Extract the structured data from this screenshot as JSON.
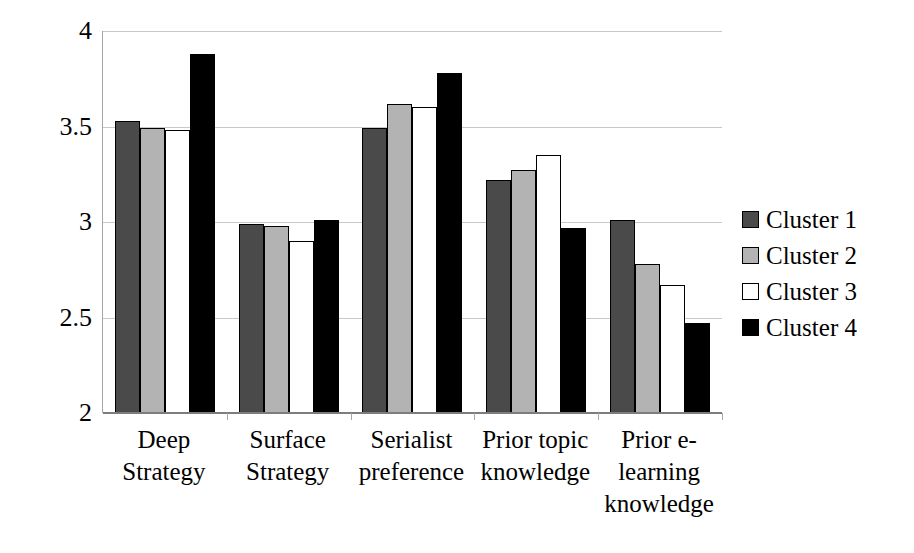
{
  "chart_data": {
    "type": "bar",
    "title": "",
    "xlabel": "",
    "ylabel": "",
    "ylim": [
      2,
      4
    ],
    "yticks": [
      2,
      2.5,
      3,
      3.5,
      4
    ],
    "ytick_labels": [
      "2",
      "2.5",
      "3",
      "3.5",
      "4"
    ],
    "grid": true,
    "legend_position": "right",
    "categories": [
      "Deep Strategy",
      "Surface Strategy",
      "Serialist preference",
      "Prior topic knowledge",
      "Prior e-learning knowledge"
    ],
    "category_lines": [
      [
        "Deep",
        "Strategy"
      ],
      [
        "Surface",
        "Strategy"
      ],
      [
        "Serialist",
        "preference"
      ],
      [
        "Prior topic",
        "knowledge"
      ],
      [
        "Prior e-",
        "learning",
        "knowledge"
      ]
    ],
    "series": [
      {
        "name": "Cluster 1",
        "color": "#4a4a4a",
        "values": [
          3.53,
          2.99,
          3.49,
          3.22,
          3.01
        ]
      },
      {
        "name": "Cluster 2",
        "color": "#b3b3b3",
        "values": [
          3.49,
          2.98,
          3.62,
          3.27,
          2.78
        ]
      },
      {
        "name": "Cluster 3",
        "color": "#ffffff",
        "values": [
          3.48,
          2.9,
          3.6,
          3.35,
          2.67
        ]
      },
      {
        "name": "Cluster 4",
        "color": "#000000",
        "values": [
          3.88,
          3.01,
          3.78,
          2.97,
          2.47
        ]
      }
    ]
  },
  "legend": {
    "items": [
      {
        "label": "Cluster 1",
        "swatch": "#4a4a4a"
      },
      {
        "label": "Cluster 2",
        "swatch": "#b3b3b3"
      },
      {
        "label": "Cluster 3",
        "swatch": "#ffffff"
      },
      {
        "label": "Cluster 4",
        "swatch": "#000000"
      }
    ]
  },
  "colors": {
    "gridline": "#c9c9c9",
    "axis": "#a6a6a6",
    "baseline": "#7d7d7d",
    "bar_outline": "#000000",
    "background": "#ffffff"
  }
}
